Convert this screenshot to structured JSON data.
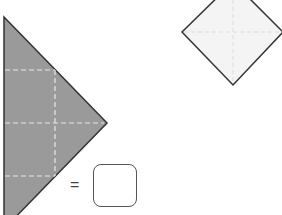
{
  "figure": {
    "shaded_triangle": {
      "fill": "#9a9a9a",
      "stroke": "#333333",
      "fold_lines": "dashed",
      "fold_line_color": "#e6e6e6"
    },
    "diamond": {
      "fill": "#f4f4f4",
      "stroke": "#333333",
      "fold_lines": "dashed",
      "fold_line_color": "#dddddd"
    },
    "equation": {
      "equals_sign": "=",
      "answer_box_value": ""
    }
  }
}
